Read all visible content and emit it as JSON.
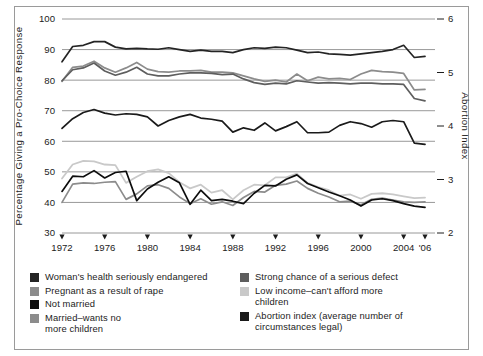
{
  "figure": {
    "background": "#ffffff",
    "frame_color": "#9a9a9a"
  },
  "axes": {
    "left_title": "Percentage  Giving a Pro-Choice Response",
    "right_title": "Abortion Index",
    "left_ticks": [
      "100",
      "90",
      "80",
      "70",
      "60",
      "50",
      "40",
      "30"
    ],
    "right_ticks": [
      "6",
      "5",
      "4",
      "3",
      "2"
    ],
    "x_ticks": [
      "1972",
      "1976",
      "1980",
      "1984",
      "1988",
      "1992",
      "1996",
      "2000",
      "2004",
      "'06"
    ]
  },
  "legend": {
    "left_items": [
      {
        "label": "Woman's health seriously endangered",
        "color": "#242424"
      },
      {
        "label": "Pregnant as a result of rape",
        "color": "#8c8c8c"
      },
      {
        "label": "Not married",
        "color": "#0d0d0d"
      },
      {
        "label": "Married–wants no\nmore children",
        "color": "#8c8c8c"
      }
    ],
    "right_items": [
      {
        "label": "Strong chance of a serious defect",
        "color": "#5e5e5e"
      },
      {
        "label": "Low income–can't afford more\nchildren",
        "color": "#c9c9c9"
      },
      {
        "label": "Abortion index (average number of\ncircumstances legal)",
        "color": "#1a1a1a"
      }
    ]
  },
  "chart_data": {
    "type": "line",
    "title": "",
    "xlabel": "",
    "ylabel": "Percentage  Giving a Pro-Choice Response",
    "y2label": "Abortion Index",
    "grid": true,
    "legend_position": "bottom",
    "ylim": [
      30,
      100
    ],
    "y2lim": [
      2,
      6
    ],
    "xlim": [
      1972,
      2006
    ],
    "x": [
      1972,
      1973,
      1974,
      1975,
      1976,
      1977,
      1978,
      1979,
      1980,
      1981,
      1982,
      1983,
      1984,
      1985,
      1986,
      1987,
      1988,
      1989,
      1990,
      1991,
      1992,
      1993,
      1994,
      1995,
      1996,
      1997,
      1998,
      1999,
      2000,
      2001,
      2002,
      2003,
      2004,
      2005,
      2006
    ],
    "series": [
      {
        "name": "Woman's health seriously endangered",
        "color": "#242424",
        "axis": "left",
        "values": [
          86.0,
          91.0,
          91.4,
          92.6,
          92.6,
          90.8,
          90.2,
          90.4,
          90.2,
          90.1,
          90.6,
          90.0,
          89.4,
          89.8,
          89.4,
          89.4,
          89.0,
          90.0,
          90.6,
          90.4,
          90.8,
          90.6,
          89.8,
          89.0,
          89.2,
          88.6,
          88.4,
          88.2,
          88.6,
          89.0,
          89.4,
          90.0,
          91.4,
          87.4,
          87.8
        ],
        "y2_values": [
          5.06,
          5.34,
          5.37,
          5.44,
          5.44,
          5.33,
          5.3,
          5.31,
          5.3,
          5.29,
          5.32,
          5.29,
          5.25,
          5.27,
          5.25,
          5.25,
          5.23,
          5.29,
          5.32,
          5.31,
          5.33,
          5.32,
          5.27,
          5.23,
          5.24,
          5.21,
          5.19,
          5.18,
          5.21,
          5.23,
          5.25,
          5.29,
          5.37,
          5.14,
          5.16
        ]
      },
      {
        "name": "Pregnant as a result of rape",
        "color": "#8c8c8c",
        "axis": "left",
        "values": [
          79.6,
          84.2,
          84.6,
          86.2,
          84.0,
          82.6,
          84.0,
          85.8,
          83.6,
          82.8,
          82.6,
          83.0,
          83.0,
          83.2,
          82.6,
          82.6,
          82.4,
          81.4,
          80.4,
          79.6,
          80.0,
          79.4,
          82.0,
          79.8,
          81.0,
          80.4,
          80.6,
          80.2,
          82.0,
          83.2,
          82.8,
          82.6,
          82.2,
          76.8,
          77.0
        ],
        "y2_values": [
          4.69,
          4.95,
          4.98,
          5.07,
          4.94,
          4.86,
          4.94,
          5.05,
          4.92,
          4.87,
          4.86,
          4.89,
          4.89,
          4.9,
          4.86,
          4.86,
          4.85,
          4.79,
          4.74,
          4.69,
          4.71,
          4.68,
          4.83,
          4.7,
          4.77,
          4.74,
          4.75,
          4.73,
          4.83,
          4.9,
          4.87,
          4.86,
          4.84,
          4.53,
          4.54
        ]
      },
      {
        "name": "Strong chance of a serious defect",
        "color": "#5e5e5e",
        "axis": "left",
        "values": [
          79.8,
          83.4,
          84.0,
          85.6,
          83.0,
          81.6,
          82.6,
          84.2,
          82.0,
          81.4,
          81.4,
          82.0,
          82.4,
          82.4,
          82.2,
          81.8,
          82.0,
          80.4,
          79.2,
          78.6,
          79.0,
          78.8,
          79.8,
          79.4,
          79.0,
          79.2,
          79.0,
          78.8,
          79.0,
          79.0,
          78.8,
          78.8,
          78.6,
          74.0,
          73.2
        ],
        "y2_values": [
          4.7,
          4.9,
          4.94,
          5.03,
          4.88,
          4.8,
          4.86,
          4.95,
          4.83,
          4.79,
          4.79,
          4.83,
          4.85,
          4.85,
          4.84,
          4.82,
          4.83,
          4.74,
          4.67,
          4.63,
          4.66,
          4.64,
          4.7,
          4.67,
          4.65,
          4.66,
          4.65,
          4.64,
          4.65,
          4.65,
          4.64,
          4.64,
          4.63,
          4.35,
          4.31
        ]
      },
      {
        "name": "Abortion index (average number of circumstances legal)",
        "color": "#1a1a1a",
        "axis": "right",
        "values": [
          64.2,
          67.4,
          69.4,
          70.4,
          69.2,
          68.6,
          69.0,
          68.8,
          68.0,
          65.0,
          66.8,
          68.0,
          68.8,
          67.6,
          67.2,
          66.6,
          63.0,
          64.4,
          63.6,
          66.0,
          63.4,
          64.8,
          66.4,
          62.8,
          62.8,
          63.0,
          65.2,
          66.4,
          65.8,
          64.6,
          66.4,
          66.8,
          66.4,
          59.4,
          59.0
        ],
        "y2_values": [
          3.23,
          3.42,
          3.54,
          3.6,
          3.52,
          3.49,
          3.51,
          3.5,
          3.46,
          3.28,
          3.38,
          3.46,
          3.5,
          3.43,
          3.41,
          3.37,
          3.17,
          3.25,
          3.2,
          3.32,
          3.19,
          3.27,
          3.36,
          3.16,
          3.16,
          3.17,
          3.3,
          3.36,
          3.33,
          3.26,
          3.36,
          3.38,
          3.36,
          2.96,
          2.94
        ]
      },
      {
        "name": "Low income–can't afford more children",
        "color": "#c9c9c9",
        "axis": "left",
        "values": [
          47.8,
          52.4,
          53.6,
          53.4,
          52.4,
          52.2,
          46.4,
          48.4,
          50.2,
          50.8,
          49.6,
          46.6,
          44.6,
          45.8,
          43.2,
          44.0,
          41.0,
          44.0,
          45.8,
          45.6,
          48.2,
          48.2,
          49.4,
          46.4,
          45.0,
          44.0,
          42.2,
          42.6,
          41.2,
          42.8,
          43.0,
          42.6,
          42.0,
          41.4,
          41.6
        ],
        "y2_values": [
          2.73,
          2.99,
          3.06,
          3.05,
          2.99,
          2.98,
          2.65,
          2.77,
          2.87,
          2.9,
          2.83,
          2.66,
          2.55,
          2.62,
          2.47,
          2.51,
          2.34,
          2.51,
          2.62,
          2.6,
          2.75,
          2.75,
          2.82,
          2.65,
          2.57,
          2.51,
          2.41,
          2.43,
          2.35,
          2.45,
          2.46,
          2.43,
          2.4,
          2.37,
          2.38
        ]
      },
      {
        "name": "Married–wants no more children",
        "color": "#8c8c8c",
        "axis": "left",
        "values": [
          40.0,
          46.0,
          46.4,
          46.2,
          46.6,
          46.8,
          41.0,
          42.8,
          45.4,
          45.8,
          44.6,
          41.8,
          39.6,
          41.2,
          39.4,
          40.2,
          39.0,
          41.6,
          43.6,
          43.4,
          45.6,
          46.0,
          47.0,
          44.6,
          43.0,
          41.8,
          40.2,
          40.4,
          39.2,
          41.0,
          41.4,
          40.8,
          40.2,
          40.0,
          40.2
        ],
        "y2_values": [
          2.29,
          2.63,
          2.65,
          2.64,
          2.66,
          2.67,
          2.34,
          2.45,
          2.59,
          2.62,
          2.55,
          2.39,
          2.26,
          2.35,
          2.25,
          2.3,
          2.23,
          2.38,
          2.49,
          2.48,
          2.61,
          2.63,
          2.69,
          2.55,
          2.46,
          2.39,
          2.3,
          2.31,
          2.24,
          2.34,
          2.37,
          2.33,
          2.3,
          2.29,
          2.3
        ]
      },
      {
        "name": "Not married",
        "color": "#0d0d0d",
        "axis": "left",
        "values": [
          43.6,
          48.6,
          48.4,
          50.4,
          48.0,
          49.8,
          50.2,
          40.6,
          44.4,
          46.6,
          48.4,
          46.4,
          39.4,
          44.0,
          40.6,
          41.0,
          40.4,
          39.6,
          43.0,
          45.6,
          45.4,
          47.6,
          49.0,
          46.2,
          44.8,
          43.4,
          42.2,
          40.8,
          38.8,
          40.8,
          41.2,
          40.6,
          39.6,
          38.8,
          38.4
        ],
        "y2_values": [
          2.49,
          2.78,
          2.77,
          2.88,
          2.74,
          2.85,
          2.87,
          2.32,
          2.54,
          2.66,
          2.77,
          2.65,
          2.25,
          2.51,
          2.32,
          2.34,
          2.31,
          2.26,
          2.46,
          2.6,
          2.59,
          2.72,
          2.8,
          2.64,
          2.56,
          2.48,
          2.41,
          2.33,
          2.22,
          2.33,
          2.35,
          2.32,
          2.26,
          2.22,
          2.19
        ]
      }
    ]
  }
}
